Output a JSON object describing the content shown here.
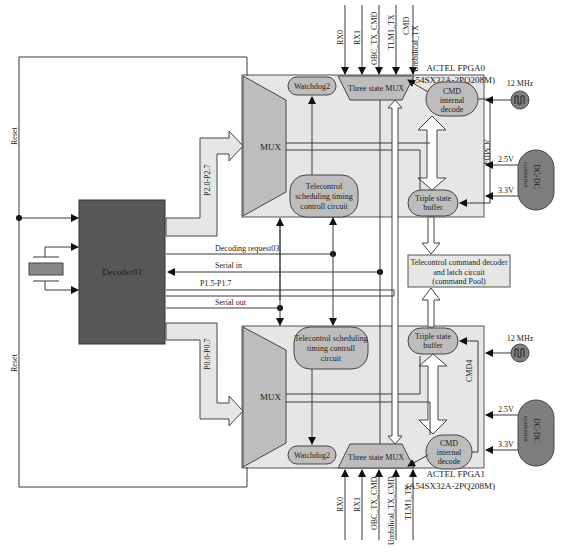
{
  "diagram": {
    "decoder": {
      "label": "Decoder03"
    },
    "reset_label_top": "Reset",
    "reset_label_bottom": "Reset",
    "buses": {
      "p2": "P2.0-P2.7",
      "p0": "P0.0-P0.7",
      "p1": "P1.5-P1.7"
    },
    "signals": {
      "decoding_request": "Decoding request03",
      "serial_in": "Serial in",
      "serial_out": "Serial out"
    },
    "fpga0": {
      "name": "ACTEL FPGA0",
      "part": "(A54SX32A-2PQ208M)",
      "mux": "MUX",
      "watchdog": "Watchdog2",
      "three_state_mux": "Three state MUX",
      "cmd_decode": [
        "CMD",
        "internal",
        "decode"
      ],
      "tc_sched": [
        "Telecontrol",
        "scheduling timing",
        "controll circuit"
      ],
      "triple_buffer": [
        "Triple state",
        "buffer"
      ],
      "cmd_bus": "/CMD4",
      "inputs": [
        "RX0",
        "RX1",
        "OBC_TX_CMD",
        "TLM1_TX",
        "CMD",
        "Umbilical_TX"
      ]
    },
    "fpga1": {
      "name": "ACTEL FPGA1",
      "part": "(A54SX32A-2PQ208M)",
      "mux": "MUX",
      "watchdog": "Watchdog2",
      "three_state_mux": "Three state MUX",
      "cmd_decode": [
        "CMD",
        "internal",
        "decode"
      ],
      "tc_sched": [
        "Telecontrol scheduling",
        "timing controll",
        "circuit"
      ],
      "triple_buffer": [
        "Triple state",
        "buffer"
      ],
      "cmd_bus": "CMD4",
      "inputs": [
        "RX0",
        "RX1",
        "OBC_TX_CMD",
        "Umbilical_TX_CMD",
        "TLM1_TX"
      ]
    },
    "pool": [
      "Telecontrol command decoder",
      "and latch circuit",
      "(command Pool)"
    ],
    "clock_top": "12 MHz",
    "clock_bottom": "12 MHz",
    "dcdc_top": {
      "label": "DC-DC",
      "sub": "converter",
      "v1": "2.5V",
      "v2": "3.3V"
    },
    "dcdc_bottom": {
      "label": "DC-DC",
      "sub": "converter",
      "v1": "2.5V",
      "v2": "3.3V"
    }
  }
}
